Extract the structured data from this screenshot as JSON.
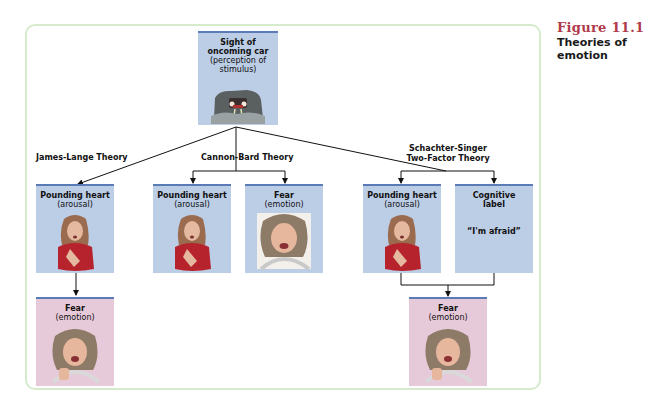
{
  "caption": {
    "figure_number": "Figure 11.1",
    "title": "Theories of emotion"
  },
  "colors": {
    "frame_border": "#d6ebcc",
    "box_blue": "#bccde6",
    "box_pink": "#e7cad9",
    "box_top_rule": "#5b7bb6",
    "figure_number": "#b03a4a"
  },
  "root": {
    "line1": "Sight of oncoming car",
    "line2": "(perception of stimulus)",
    "image": "oncoming-car-headlights-illustration"
  },
  "theories": [
    {
      "name": "James-Lange Theory",
      "boxes": [
        {
          "title": "Pounding heart",
          "subtitle": "(arousal)",
          "image": "woman-hand-on-chest-illustration"
        },
        {
          "title": "Fear",
          "subtitle": "(emotion)",
          "image": "frightened-woman-driving-illustration"
        }
      ]
    },
    {
      "name": "Cannon-Bard Theory",
      "boxes": [
        {
          "title": "Pounding heart",
          "subtitle": "(arousal)",
          "image": "woman-hand-on-chest-illustration"
        },
        {
          "title": "Fear",
          "subtitle": "(emotion)",
          "image": "frightened-woman-driving-illustration"
        }
      ]
    },
    {
      "name_line1": "Schachter-Singer",
      "name_line2": "Two-Factor Theory",
      "boxes": [
        {
          "title": "Pounding heart",
          "subtitle": "(arousal)",
          "image": "woman-hand-on-chest-illustration"
        },
        {
          "title_line1": "Cognitive",
          "title_line2": "label",
          "quote": "“I'm afraid”"
        },
        {
          "title": "Fear",
          "subtitle": "(emotion)",
          "image": "frightened-woman-driving-illustration"
        }
      ]
    }
  ]
}
